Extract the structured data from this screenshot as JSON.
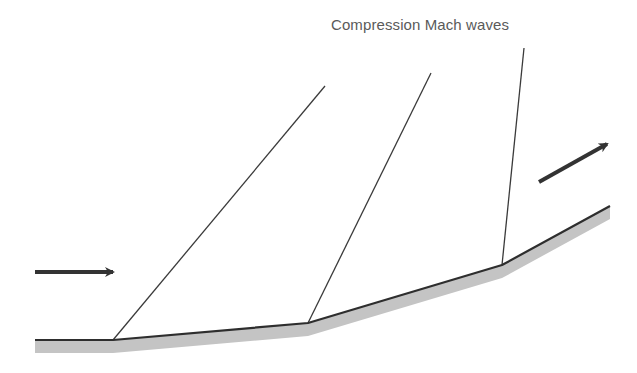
{
  "diagram": {
    "title_label": "Compression Mach waves",
    "colors": {
      "wall_line": "#2e2e2e",
      "wall_fill": "#c4c4c4",
      "wave_line": "#3a3a3a",
      "arrow": "#333333",
      "label": "#5a5a5a"
    },
    "wall": {
      "points": [
        [
          35,
          340
        ],
        [
          113,
          340
        ],
        [
          308,
          323
        ],
        [
          502,
          265
        ],
        [
          610,
          206
        ]
      ],
      "band_thickness": 13
    },
    "mach_waves": [
      {
        "from": [
          113,
          340
        ],
        "to": [
          325,
          86
        ]
      },
      {
        "from": [
          308,
          323
        ],
        "to": [
          431,
          73
        ]
      },
      {
        "from": [
          502,
          265
        ],
        "to": [
          524,
          48
        ]
      }
    ],
    "flow_arrows": [
      {
        "name": "incoming-flow",
        "from": [
          35,
          272
        ],
        "to": [
          113,
          272
        ]
      },
      {
        "name": "outgoing-flow",
        "from": [
          539,
          182
        ],
        "to": [
          607,
          144
        ]
      }
    ]
  }
}
